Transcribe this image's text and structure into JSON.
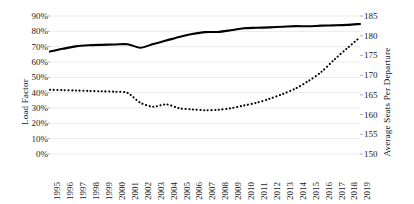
{
  "chart_data": {
    "type": "line",
    "title": "",
    "xlabel": "",
    "grid": true,
    "legend": "none",
    "x": [
      1995,
      1996,
      1997,
      1998,
      1999,
      2000,
      2001,
      2002,
      2003,
      2004,
      2005,
      2006,
      2007,
      2008,
      2009,
      2010,
      2011,
      2012,
      2013,
      2014,
      2015,
      2016,
      2017,
      2018,
      2019
    ],
    "categories": [
      "1995",
      "1996",
      "1997",
      "1998",
      "1999",
      "2000",
      "2001",
      "2002",
      "2003",
      "2004",
      "2005",
      "2006",
      "2007",
      "2008",
      "2009",
      "2010",
      "2011",
      "2012",
      "2013",
      "2014",
      "2015",
      "2016",
      "2017",
      "2018",
      "2019"
    ],
    "axes": {
      "left": {
        "label": "Load Factor",
        "ticks": [
          "0%",
          "10%",
          "20%",
          "30%",
          "40%",
          "50%",
          "60%",
          "70%",
          "80%",
          "90%"
        ],
        "tick_values": [
          0,
          10,
          20,
          30,
          40,
          50,
          60,
          70,
          80,
          90
        ],
        "ylim": [
          0,
          90
        ],
        "unit": "%"
      },
      "right": {
        "label": "Average Seats Per Departure",
        "ticks": [
          "150",
          "155",
          "160",
          "165",
          "170",
          "175",
          "180",
          "185"
        ],
        "tick_values": [
          150,
          155,
          160,
          165,
          170,
          175,
          180,
          185
        ],
        "ylim": [
          150,
          185
        ],
        "unit": "seats"
      }
    },
    "series": [
      {
        "name": "Load Factor",
        "style": "solid",
        "axis": "left",
        "color": "#000000",
        "values": [
          66.8,
          68.6,
          70.2,
          70.9,
          71.2,
          71.4,
          71.6,
          69.3,
          71.8,
          74.0,
          76.3,
          78.2,
          79.5,
          79.6,
          80.7,
          82.0,
          82.3,
          82.6,
          83.0,
          83.4,
          83.3,
          83.7,
          83.9,
          84.2,
          84.8
        ]
      },
      {
        "name": "Average Seats Per Departure",
        "style": "dotted",
        "axis": "right",
        "color": "#000000",
        "values": [
          166.3,
          166.2,
          166.1,
          166.0,
          165.9,
          165.8,
          165.5,
          163.0,
          162.0,
          162.6,
          161.6,
          161.3,
          161.1,
          161.2,
          161.6,
          162.3,
          163.0,
          164.0,
          165.2,
          166.6,
          168.5,
          170.8,
          173.9,
          176.8,
          179.6
        ]
      }
    ]
  }
}
